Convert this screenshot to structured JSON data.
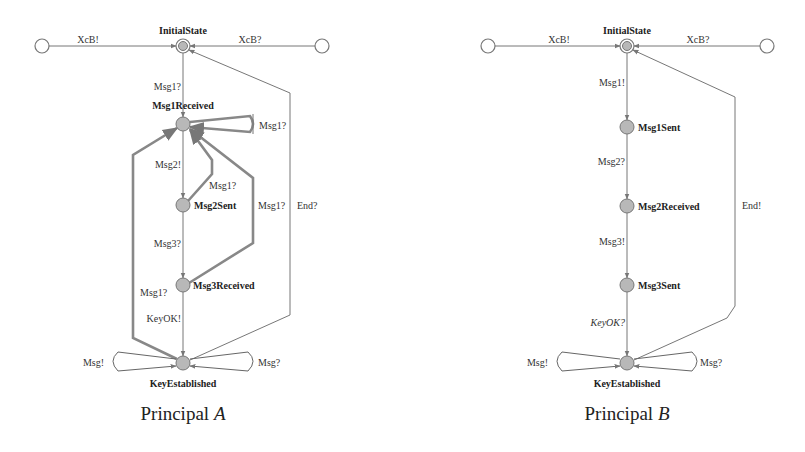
{
  "figure": {
    "diagrams": [
      {
        "caption_prefix": "Principal ",
        "caption_var": "A",
        "states": {
          "initial": "InitialState",
          "s1": "Msg1Received",
          "s2": "Msg2Sent",
          "s3": "Msg3Received",
          "final": "KeyEstablished"
        },
        "edges": {
          "left_in": "XcB!",
          "right_in": "XcB?",
          "init_to_s1": "Msg1?",
          "s1_self": "Msg1?",
          "s1_to_s2": "Msg2!",
          "s2_to_s1": "Msg1?",
          "s3_to_s1": "Msg1?",
          "final_to_s1": "Msg1?",
          "s2_to_s3": "Msg3?",
          "s3_to_final": "KeyOK!",
          "final_to_init": "End?",
          "final_loop_left": "Msg!",
          "final_loop_right": "Msg?"
        }
      },
      {
        "caption_prefix": "Principal ",
        "caption_var": "B",
        "states": {
          "initial": "InitialState",
          "s1": "Msg1Sent",
          "s2": "Msg2Received",
          "s3": "Msg3Sent",
          "final": "KeyEstablished"
        },
        "edges": {
          "left_in": "XcB!",
          "right_in": "XcB?",
          "init_to_s1": "Msg1!",
          "s1_to_s2": "Msg2?",
          "s2_to_s3": "Msg3!",
          "s3_to_final": "KeyOK?",
          "final_to_init": "End!",
          "final_loop_left": "Msg!",
          "final_loop_right": "Msg?"
        }
      }
    ]
  }
}
